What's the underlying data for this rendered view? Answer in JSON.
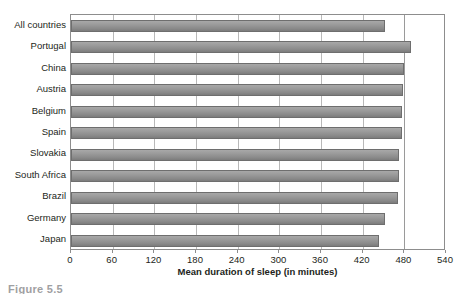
{
  "chart_data": {
    "type": "bar",
    "orientation": "horizontal",
    "title": "",
    "xlabel": "Mean duration of sleep (in minutes)",
    "ylabel": "",
    "xlim": [
      0,
      540
    ],
    "xticks": [
      0,
      60,
      120,
      180,
      240,
      300,
      360,
      420,
      480,
      540
    ],
    "grid": true,
    "legend": null,
    "categories": [
      "All countries",
      "Portugal",
      "China",
      "Austria",
      "Belgium",
      "Spain",
      "Slovakia",
      "South Africa",
      "Brazil",
      "Germany",
      "Japan"
    ],
    "values": [
      452,
      490,
      479,
      478,
      477,
      476,
      473,
      472,
      471,
      452,
      444
    ],
    "series": [
      {
        "name": "Mean duration of sleep (in minutes)",
        "values": [
          452,
          490,
          479,
          478,
          477,
          476,
          473,
          472,
          471,
          452,
          444
        ]
      }
    ],
    "bar_color": "#9a9a9a",
    "bar_border_color": "#6e6e6e",
    "gridline_color": "#b9b9b9",
    "axis_color": "#8d8d8d",
    "text_color": "#231f20"
  },
  "caption": {
    "text": "Figure 5.5",
    "color": "#9fa0a2"
  }
}
